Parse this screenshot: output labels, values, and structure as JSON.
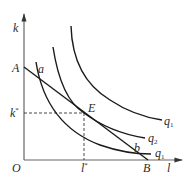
{
  "diagram": {
    "type": "isoquant-isocost",
    "axes": {
      "x_label": "l",
      "y_label": "k",
      "origin_label": "O"
    },
    "points": {
      "A": "A",
      "B": "B",
      "E": "E",
      "a": "a",
      "b": "b",
      "k_star": "k",
      "k_star_sup": "*",
      "l_star": "l",
      "l_star_sup": "*"
    },
    "curves": [
      {
        "name": "q",
        "sub": "1"
      },
      {
        "name": "q",
        "sub": "2"
      },
      {
        "name": "q",
        "sub": "1"
      }
    ],
    "colors": {
      "line": "#1a1a1a",
      "axis": "#555555",
      "text": "#2a2a2a"
    }
  }
}
